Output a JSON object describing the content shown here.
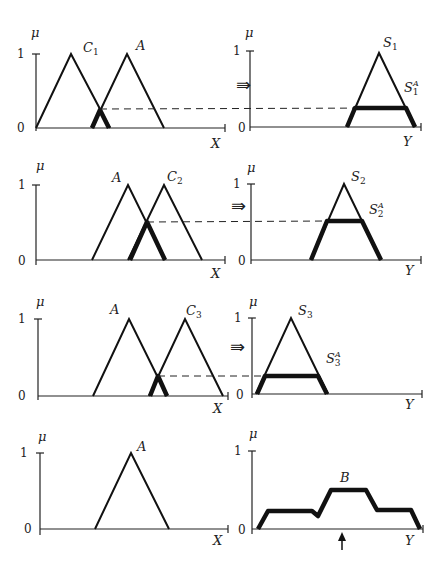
{
  "figure": {
    "axis_labels": {
      "membership": "μ",
      "input_axis": "X",
      "output_axis": "Y",
      "one": "1",
      "zero": "0"
    },
    "implication_symbol": "⇛",
    "rows": [
      {
        "left_sets": [
          "C",
          "A"
        ],
        "antecedent": "C",
        "antecedent_sub": "1",
        "input": "A",
        "consequent": "S",
        "consequent_sub": "1",
        "clipped": "S",
        "clipped_sub": "1",
        "clipped_sup": "A",
        "match_degree": 0.25
      },
      {
        "antecedent": "C",
        "antecedent_sub": "2",
        "input": "A",
        "consequent": "S",
        "consequent_sub": "2",
        "clipped": "S",
        "clipped_sub": "2",
        "clipped_sup": "A",
        "match_degree": 0.5
      },
      {
        "antecedent": "C",
        "antecedent_sub": "3",
        "input": "A",
        "consequent": "S",
        "consequent_sub": "3",
        "clipped": "S",
        "clipped_sub": "3",
        "clipped_sup": "A",
        "match_degree": 0.25
      },
      {
        "input": "A",
        "output": "B"
      }
    ],
    "output_marker": "↑"
  }
}
